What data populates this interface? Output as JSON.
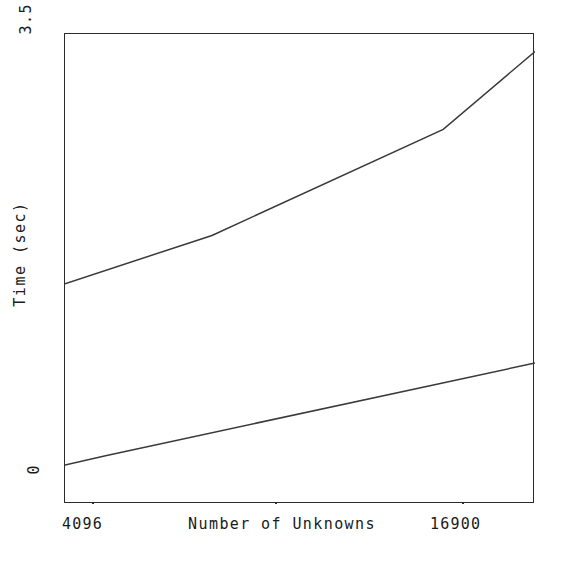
{
  "chart_data": {
    "type": "line",
    "title": "",
    "xlabel": "Number of Unknowns",
    "ylabel": "Time (sec)",
    "xlim": [
      4096,
      16900
    ],
    "ylim": [
      0,
      3.5
    ],
    "grid": false,
    "legend": "none",
    "x_tick_labels": [
      "4096",
      "16900"
    ],
    "y_tick_labels": [
      "3.5",
      "0"
    ],
    "y_tick_values": [
      3.5,
      0
    ],
    "x_tick_values": [
      4096,
      16900
    ],
    "x": [
      4096,
      8100,
      14400,
      16900
    ],
    "series": [
      {
        "name": "upper-curve",
        "x": [
          4096,
          8100,
          14400,
          16900
        ],
        "values": [
          1.64,
          2.0,
          2.79,
          3.37
        ],
        "color": "#3a3a3a"
      },
      {
        "name": "lower-curve",
        "x": [
          4096,
          5200,
          16900
        ],
        "values": [
          0.29,
          0.36,
          1.05
        ],
        "color": "#3a3a3a"
      }
    ],
    "annotations": []
  },
  "axis": {
    "y_title": "Time (sec)",
    "x_title": "Number of Unknowns",
    "y_top_label": "3.5",
    "y_bottom_label": "0",
    "x_left_label": "4096",
    "x_right_label": "16900"
  }
}
